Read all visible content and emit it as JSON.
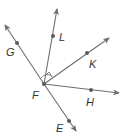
{
  "diagram": {
    "type": "geometry-rays",
    "vertex": {
      "label": "F",
      "x": 44,
      "y": 84,
      "label_x": 32,
      "label_y": 99
    },
    "rays": [
      {
        "name": "G",
        "label": "G",
        "tip_x": 5,
        "tip_y": 25,
        "point_x": 17,
        "point_y": 43,
        "label_x": 6,
        "label_y": 56
      },
      {
        "name": "L",
        "label": "L",
        "tip_x": 57,
        "tip_y": 9,
        "point_x": 53,
        "point_y": 36,
        "label_x": 59,
        "label_y": 41
      },
      {
        "name": "K",
        "label": "K",
        "tip_x": 109,
        "tip_y": 38,
        "point_x": 87,
        "point_y": 53,
        "label_x": 89,
        "label_y": 68
      },
      {
        "name": "H",
        "label": "H",
        "tip_x": 119,
        "tip_y": 93,
        "point_x": 91,
        "point_y": 90,
        "label_x": 86,
        "label_y": 106
      },
      {
        "name": "E",
        "label": "E",
        "tip_x": 76,
        "tip_y": 131,
        "point_x": 69,
        "point_y": 121,
        "label_x": 56,
        "label_y": 132
      }
    ],
    "colors": {
      "ray": "#6e6e6e",
      "point": "#5a5a5a",
      "label": "#333333"
    }
  }
}
